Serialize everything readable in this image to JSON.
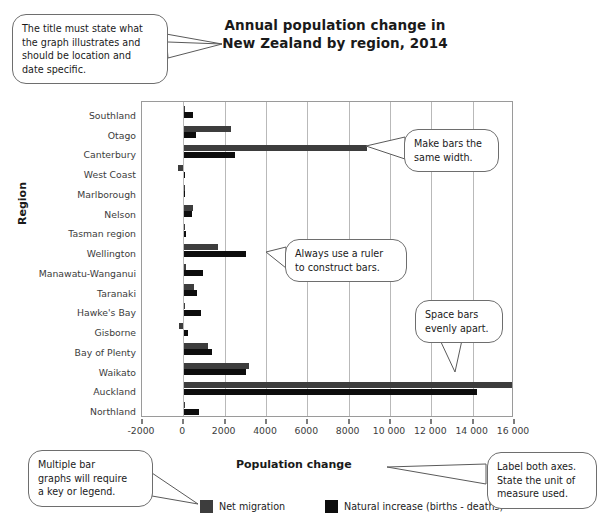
{
  "chart_data": {
    "type": "bar",
    "orientation": "horizontal",
    "title": "Annual population change in\nNew Zealand by region, 2014",
    "title_line1": "Annual population change in",
    "title_line2": "New Zealand by region, 2014",
    "xlabel": "Population change",
    "ylabel": "Region",
    "xlim": [
      -2000,
      16000
    ],
    "xticks": [
      -2000,
      0,
      2000,
      4000,
      6000,
      8000,
      10000,
      12000,
      14000,
      16000
    ],
    "xtick_labels": [
      "-2000",
      "0",
      "2000",
      "4000",
      "6000",
      "8000",
      "10 000",
      "12 000",
      "14 000",
      "16 000"
    ],
    "grid": "vertical",
    "legend_position": "bottom",
    "categories": [
      "Southland",
      "Otago",
      "Canterbury",
      "West Coast",
      "Marlborough",
      "Nelson",
      "Tasman region",
      "Wellington",
      "Manawatu-Wanganui",
      "Taranaki",
      "Hawke's Bay",
      "Gisborne",
      "Bay of Plenty",
      "Waikato",
      "Auckland",
      "Northland"
    ],
    "series": [
      {
        "name": "Net migration",
        "color": "#3d3d3d",
        "values": [
          100,
          2300,
          8900,
          -250,
          50,
          450,
          70,
          1700,
          150,
          500,
          60,
          -200,
          1200,
          3200,
          16000,
          40
        ]
      },
      {
        "name": "Natural increase (births - deaths)",
        "color": "#0d0d0d",
        "values": [
          450,
          600,
          2500,
          80,
          90,
          400,
          120,
          3050,
          950,
          650,
          850,
          250,
          1400,
          3050,
          14200,
          750
        ]
      }
    ]
  },
  "callouts": [
    {
      "id": "title-callout",
      "lines": [
        "The title must state what",
        "the graph illustrates and",
        "should be location and",
        "date specific."
      ]
    },
    {
      "id": "bar-width-callout",
      "lines": [
        "Make bars the",
        "same width."
      ]
    },
    {
      "id": "ruler-callout",
      "lines": [
        "Always use a ruler",
        "to construct bars."
      ]
    },
    {
      "id": "spacing-callout",
      "lines": [
        "Space bars",
        "evenly apart."
      ]
    },
    {
      "id": "legend-callout",
      "lines": [
        "Multiple bar",
        "graphs will require",
        "a key or legend."
      ]
    },
    {
      "id": "axes-callout",
      "lines": [
        "Label both axes.",
        "State the unit of",
        "measure used."
      ]
    }
  ]
}
